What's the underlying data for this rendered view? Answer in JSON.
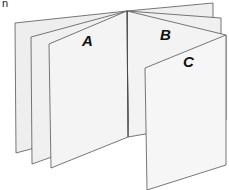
{
  "corner_text": "n",
  "labels": {
    "a": "A",
    "b": "B",
    "c": "C"
  },
  "colors": {
    "page_fill": "#f2f2f2",
    "page_fill_front": "#f6f6f6",
    "stroke": "#555555"
  }
}
